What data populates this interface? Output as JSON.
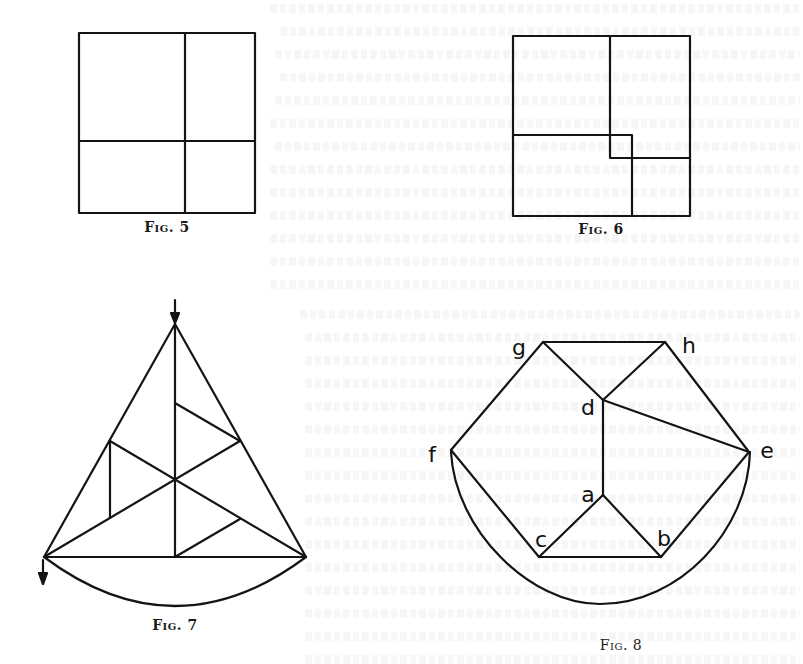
{
  "figures": {
    "fig5": {
      "caption": "Fig. 5",
      "caption_pos": {
        "x": 167,
        "y": 228
      },
      "shape": "square divided into four rectangles by one vertical and one horizontal line",
      "outer": {
        "x1": 79,
        "y1": 33,
        "x2": 255,
        "y2": 213
      },
      "vertical_x": 185,
      "horizontal_y": 141
    },
    "fig6": {
      "caption": "Fig. 6",
      "caption_pos": {
        "x": 601,
        "y": 230
      },
      "shape": "square divided into four rectangles around a small central square",
      "outer": {
        "x1": 513,
        "y1": 36,
        "x2": 690,
        "y2": 216
      }
    },
    "fig7": {
      "caption": "Fig. 7",
      "caption_pos": {
        "x": 175,
        "y": 626
      },
      "shape": "triangle with medians, inner segments, circular arc below the base, and two arrows",
      "apex": {
        "x": 175,
        "y": 324
      },
      "base_left": {
        "x": 44,
        "y": 557
      },
      "base_right": {
        "x": 306,
        "y": 557
      },
      "centroid": {
        "x": 175,
        "y": 480
      }
    },
    "fig8": {
      "caption": "Fig. 8",
      "caption_pos": {
        "x": 621,
        "y": 646
      },
      "shape": "hexagon-like dissection with labelled vertices and circular arc below",
      "labels": [
        {
          "text": "g",
          "x": 519,
          "y": 348
        },
        {
          "text": "h",
          "x": 689,
          "y": 348
        },
        {
          "text": "d",
          "x": 588,
          "y": 409
        },
        {
          "text": "f",
          "x": 432,
          "y": 456
        },
        {
          "text": "e",
          "x": 767,
          "y": 452
        },
        {
          "text": "a",
          "x": 588,
          "y": 496
        },
        {
          "text": "c",
          "x": 541,
          "y": 540
        },
        {
          "text": "b",
          "x": 663,
          "y": 540
        }
      ]
    }
  }
}
